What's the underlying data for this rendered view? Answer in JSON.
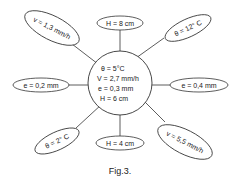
{
  "center": {
    "lines": [
      "θ = 5°C",
      "V = 2,7 mm/h",
      "e = 0,3 mm",
      "H = 6 cm"
    ]
  },
  "nodes": [
    {
      "id": "top",
      "label": "H = 8 cm"
    },
    {
      "id": "top-right",
      "label": "θ = 12° C"
    },
    {
      "id": "right",
      "label": "e = 0,4 mm"
    },
    {
      "id": "bottom-right",
      "label": "v = 5,5 mm/h"
    },
    {
      "id": "bottom",
      "label": "H = 4 cm"
    },
    {
      "id": "bottom-left",
      "label": "θ = 2° C"
    },
    {
      "id": "left",
      "label": "e = 0,2 mm"
    },
    {
      "id": "top-left",
      "label": "v = 1,3 mm/h"
    }
  ],
  "caption": "Fig.3."
}
